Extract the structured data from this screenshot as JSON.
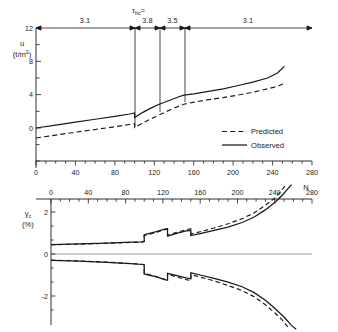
{
  "figure": {
    "background_color": "#ffffff",
    "line_color": "#1a1a1a",
    "axis_color": "#1a1a1a"
  },
  "chart_data": [
    {
      "type": "line",
      "id": "pore-pressure-chart",
      "title": "",
      "xlabel": "",
      "ylabel": "u (t/m2)",
      "ylabel_symbol": "u",
      "ylabel_units": "(t/m²)",
      "xlim": [
        0,
        280
      ],
      "ylim": [
        -1.6,
        12
      ],
      "yticks": [
        0,
        4,
        8,
        12
      ],
      "ytick_labels": [
        "0",
        "4",
        "8",
        "12"
      ],
      "xticks": [
        0,
        40,
        80,
        120,
        160,
        200,
        240,
        280
      ],
      "xtick_labels": [
        "0",
        "40",
        "80",
        "120",
        "160",
        "200",
        "240",
        "280"
      ],
      "xtick_minor_step": 10,
      "grid": false,
      "legend_position": "lower right",
      "legend": [
        {
          "name": "Predicted",
          "style": "dashed"
        },
        {
          "name": "Observed",
          "style": "solid"
        }
      ],
      "annotation_header": "τhc =",
      "annotation_header_symbol": "τ",
      "annotation_header_subscript": "hc",
      "annotation_header_suffix": "=",
      "segments": [
        {
          "label": "3.1",
          "x_start": 0,
          "x_end": 100
        },
        {
          "label": "3.8",
          "x_start": 100,
          "x_end": 125
        },
        {
          "label": "3.5",
          "x_start": 125,
          "x_end": 150
        },
        {
          "label": "3.1",
          "x_start": 150,
          "x_end": 280
        }
      ],
      "divider_lines": [
        {
          "x": 100,
          "y_top": 12,
          "y_bottom": 1.6
        },
        {
          "x": 125,
          "y_top": 12,
          "y_bottom": 3.1
        },
        {
          "x": 150,
          "y_top": 12,
          "y_bottom": 4.2
        }
      ],
      "series": [
        {
          "name": "Observed",
          "style": "solid",
          "x": [
            0,
            20,
            40,
            60,
            80,
            95,
            100,
            100,
            108,
            115,
            125,
            135,
            145,
            150,
            160,
            175,
            190,
            205,
            220,
            235,
            245,
            252
          ],
          "y": [
            0.0,
            0.35,
            0.7,
            1.05,
            1.4,
            1.68,
            1.8,
            1.25,
            1.85,
            2.3,
            2.85,
            3.3,
            3.75,
            3.95,
            4.1,
            4.4,
            4.7,
            5.1,
            5.5,
            6.0,
            6.6,
            7.4
          ]
        },
        {
          "name": "Predicted",
          "style": "dashed",
          "x": [
            0,
            20,
            40,
            60,
            80,
            95,
            100,
            100,
            110,
            120,
            130,
            140,
            150,
            160,
            175,
            190,
            205,
            220,
            235,
            245,
            252
          ],
          "y": [
            -1.2,
            -0.85,
            -0.5,
            -0.18,
            0.15,
            0.42,
            0.5,
            0.05,
            0.7,
            1.3,
            1.85,
            2.4,
            2.85,
            3.1,
            3.4,
            3.65,
            3.95,
            4.3,
            4.7,
            5.0,
            5.35
          ]
        }
      ]
    },
    {
      "type": "line",
      "id": "cyclic-shear-strain-chart",
      "title": "",
      "xlabel": "N",
      "ylabel": "γc (%)",
      "ylabel_symbol": "γ",
      "ylabel_subscript": "c",
      "ylabel_units": "(%)",
      "xlim": [
        0,
        280
      ],
      "ylim": [
        -3.6,
        3.3
      ],
      "yticks": [
        -2,
        0,
        2
      ],
      "ytick_labels": [
        "-2",
        "0",
        "2"
      ],
      "xticks": [
        0,
        40,
        80,
        120,
        160,
        200,
        240,
        280
      ],
      "xtick_labels": [
        "0",
        "40",
        "80",
        "120",
        "160",
        "200",
        "240",
        "280"
      ],
      "xtick_minor_step": 10,
      "xaxis_position": "top",
      "grid": false,
      "zero_line": true,
      "series": [
        {
          "name": "Observed upper",
          "style": "solid",
          "x": [
            0,
            30,
            60,
            85,
            98,
            100,
            100,
            112,
            122,
            125,
            125,
            134,
            145,
            150,
            150,
            160,
            175,
            190,
            205,
            218,
            230,
            240,
            248,
            254,
            258
          ],
          "y": [
            0.45,
            0.48,
            0.52,
            0.56,
            0.58,
            0.6,
            0.92,
            1.05,
            1.18,
            1.2,
            0.85,
            0.97,
            1.1,
            1.13,
            0.88,
            0.97,
            1.12,
            1.28,
            1.5,
            1.76,
            2.1,
            2.45,
            2.8,
            3.1,
            3.3
          ]
        },
        {
          "name": "Predicted upper",
          "style": "dashed",
          "x": [
            0,
            30,
            60,
            85,
            98,
            100,
            100,
            112,
            122,
            125,
            125,
            134,
            145,
            150,
            150,
            160,
            175,
            190,
            205,
            218,
            230,
            240,
            246,
            252
          ],
          "y": [
            0.44,
            0.47,
            0.51,
            0.55,
            0.57,
            0.59,
            0.88,
            1.02,
            1.16,
            1.19,
            0.9,
            1.02,
            1.16,
            1.2,
            0.95,
            1.06,
            1.24,
            1.44,
            1.68,
            1.96,
            2.32,
            2.66,
            2.95,
            3.3
          ]
        },
        {
          "name": "Observed lower",
          "style": "solid",
          "x": [
            0,
            30,
            60,
            85,
            98,
            100,
            100,
            112,
            122,
            125,
            125,
            134,
            145,
            150,
            150,
            160,
            175,
            190,
            205,
            218,
            230,
            240,
            250,
            258,
            263
          ],
          "y": [
            -0.3,
            -0.34,
            -0.4,
            -0.46,
            -0.5,
            -0.52,
            -0.95,
            -1.08,
            -1.22,
            -1.25,
            -0.92,
            -1.02,
            -1.14,
            -1.18,
            -0.9,
            -1.0,
            -1.16,
            -1.34,
            -1.56,
            -1.84,
            -2.2,
            -2.58,
            -3.0,
            -3.4,
            -3.58
          ]
        },
        {
          "name": "Predicted lower",
          "style": "dashed",
          "x": [
            0,
            30,
            60,
            85,
            98,
            100,
            100,
            112,
            122,
            125,
            125,
            134,
            145,
            150,
            150,
            160,
            175,
            190,
            205,
            218,
            230,
            240,
            248,
            255
          ],
          "y": [
            -0.29,
            -0.33,
            -0.39,
            -0.45,
            -0.49,
            -0.51,
            -0.92,
            -1.06,
            -1.2,
            -1.23,
            -0.96,
            -1.08,
            -1.22,
            -1.26,
            -0.98,
            -1.1,
            -1.28,
            -1.5,
            -1.74,
            -2.04,
            -2.42,
            -2.8,
            -3.14,
            -3.52
          ]
        }
      ]
    }
  ]
}
